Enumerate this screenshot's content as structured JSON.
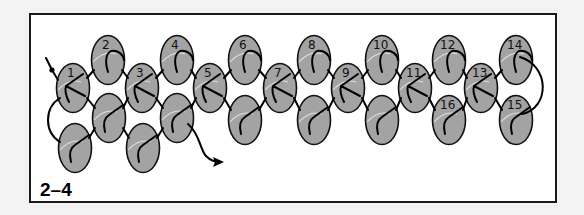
{
  "figure": {
    "label": "2–4",
    "colors": {
      "background": "#f3f3f3",
      "panel": "#ffffff",
      "bead_fill": "#a3a3a3",
      "bead_outline": "#111111",
      "thread": "#000000"
    }
  },
  "beads": [
    {
      "id": "1",
      "label": "1",
      "cx": 73,
      "cy": 88
    },
    {
      "id": "2",
      "label": "2",
      "cx": 108,
      "cy": 60
    },
    {
      "id": "3",
      "label": "3",
      "cx": 142,
      "cy": 88
    },
    {
      "id": "4",
      "label": "4",
      "cx": 177,
      "cy": 60
    },
    {
      "id": "5",
      "label": "5",
      "cx": 210,
      "cy": 88
    },
    {
      "id": "6",
      "label": "6",
      "cx": 245,
      "cy": 60
    },
    {
      "id": "7",
      "label": "7",
      "cx": 280,
      "cy": 88
    },
    {
      "id": "8",
      "label": "8",
      "cx": 314,
      "cy": 60
    },
    {
      "id": "9",
      "label": "9",
      "cx": 348,
      "cy": 88
    },
    {
      "id": "10",
      "label": "10",
      "cx": 382,
      "cy": 60
    },
    {
      "id": "11",
      "label": "11",
      "cx": 415,
      "cy": 88
    },
    {
      "id": "12",
      "label": "12",
      "cx": 449,
      "cy": 60
    },
    {
      "id": "13",
      "label": "13",
      "cx": 481,
      "cy": 88
    },
    {
      "id": "14",
      "label": "14",
      "cx": 516,
      "cy": 60
    },
    {
      "id": "15",
      "label": "15",
      "cx": 516,
      "cy": 120
    },
    {
      "id": "16",
      "label": "16",
      "cx": 449,
      "cy": 120
    },
    {
      "id": "b1",
      "label": "",
      "cx": 109,
      "cy": 118
    },
    {
      "id": "b2",
      "label": "",
      "cx": 177,
      "cy": 118
    },
    {
      "id": "b3",
      "label": "",
      "cx": 245,
      "cy": 120
    },
    {
      "id": "b4",
      "label": "",
      "cx": 314,
      "cy": 120
    },
    {
      "id": "b5",
      "label": "",
      "cx": 382,
      "cy": 120
    },
    {
      "id": "c1",
      "label": "",
      "cx": 75,
      "cy": 148
    },
    {
      "id": "c2",
      "label": "",
      "cx": 143,
      "cy": 148
    }
  ]
}
